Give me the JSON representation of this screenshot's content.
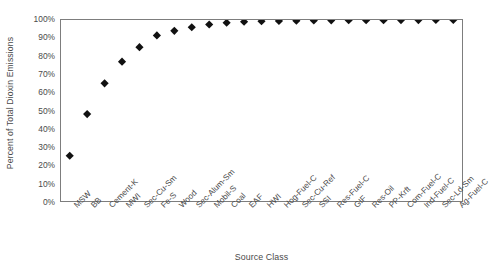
{
  "chart_data": {
    "type": "scatter",
    "title": "",
    "xlabel": "Source Class",
    "ylabel": "Percent of Total Dioxin Emissions",
    "ylim": [
      0,
      100
    ],
    "yticks": [
      0,
      10,
      20,
      30,
      40,
      50,
      60,
      70,
      80,
      90,
      100
    ],
    "ytick_labels": [
      "0%",
      "10%",
      "20%",
      "30%",
      "40%",
      "50%",
      "60%",
      "70%",
      "80%",
      "90%",
      "100%"
    ],
    "grid": false,
    "legend": "none",
    "marker": "diamond",
    "marker_color": "#111111",
    "categories": [
      "MSW",
      "BB",
      "Cement-K",
      "MWI",
      "Sec-Cu-Sm",
      "Fe-S",
      "Wood",
      "Sec-Alum-Sm",
      "Mobil-S",
      "Coal",
      "EAF",
      "HWI",
      "Hog-Fuel-C",
      "Sec-Cu-Ref",
      "SSI",
      "Res-Fuel-C",
      "GIF",
      "Res-Oil",
      "PP-Krft",
      "Com-Fuel-C",
      "Ind-Fuel-C",
      "Sec-Ld-Sm",
      "Ag-Fuel-C"
    ],
    "values": [
      25,
      48,
      65,
      77,
      85,
      91.5,
      94,
      96,
      97.5,
      98.5,
      99,
      99.3,
      99.5,
      99.6,
      99.7,
      99.8,
      99.85,
      99.9,
      99.92,
      99.94,
      99.96,
      99.98,
      100
    ]
  },
  "axis_colors": {
    "frame": "#7d7d7d",
    "text": "#4a4a4a",
    "marker": "#111111"
  }
}
